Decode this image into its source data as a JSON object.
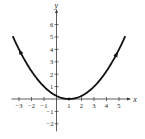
{
  "chart_data": {
    "type": "line",
    "title": "",
    "xlabel": "x",
    "ylabel": "y",
    "xlim": [
      -3.6,
      5.9
    ],
    "ylim": [
      -2.6,
      7.2
    ],
    "grid": false,
    "x_ticks": [
      -3,
      -2,
      -1,
      1,
      2,
      3,
      4,
      5
    ],
    "y_ticks": [
      -2,
      -1,
      1,
      2,
      3,
      4,
      5,
      6
    ],
    "series": [
      {
        "name": "y = (x - 1)^2 / 4",
        "function": "0.25*(x-1)^2",
        "x_range": [
          -3.5,
          5.5
        ],
        "vertex": [
          1,
          0
        ],
        "color": "#111111",
        "arrows": "direction markers along curve",
        "x": [
          -3.5,
          -3,
          -2,
          -1,
          0,
          1,
          2,
          3,
          4,
          5,
          5.5
        ],
        "values": [
          5.06,
          4,
          2.25,
          1,
          0.25,
          0,
          0.25,
          1,
          2.25,
          4,
          5.06
        ]
      }
    ]
  },
  "labels": {
    "x_axis": "x",
    "y_axis": "y",
    "x_ticks": [
      "−3",
      "−2",
      "−1",
      "1",
      "2",
      "3",
      "4",
      "5"
    ],
    "y_ticks": [
      "6",
      "5",
      "4",
      "3",
      "2",
      "1",
      "−1",
      "−2"
    ]
  }
}
